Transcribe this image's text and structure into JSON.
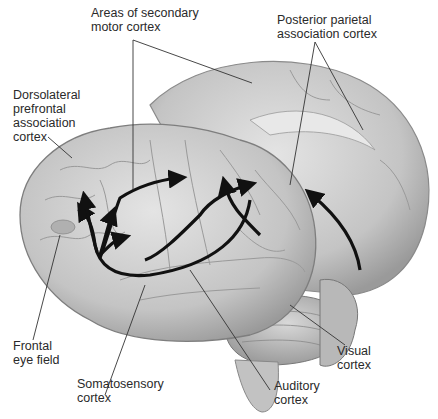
{
  "figure": {
    "labels": {
      "secondary_motor": "Areas of secondary\nmotor cortex",
      "posterior_parietal": "Posterior parietal\nassociation cortex",
      "dorsolateral_prefrontal": "Dorsolateral\nprefrontal\nassociation\ncortex",
      "frontal_eye_field": "Frontal\neye field",
      "somatosensory": "Somatosensory\ncortex",
      "auditory": "Auditory\ncortex",
      "visual": "Visual\ncortex"
    },
    "colors": {
      "brain_fill": "#c9c9c9",
      "brain_light": "#dedede",
      "brain_shadow": "#8f8f8f",
      "arrow": "#111111",
      "leader": "#333333"
    }
  }
}
